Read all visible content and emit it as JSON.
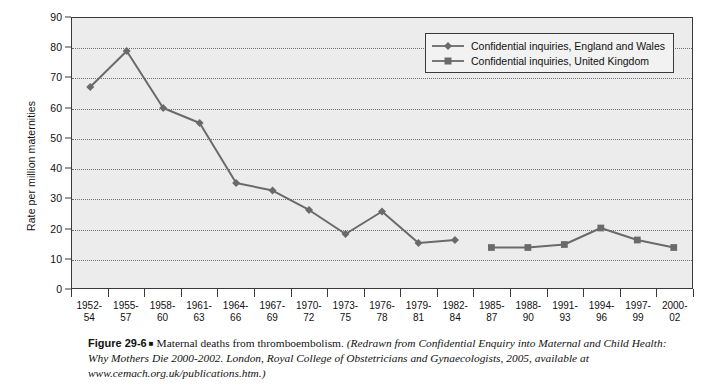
{
  "figure": {
    "number": "Figure 29-6",
    "bullet": "■",
    "description": "Maternal deaths from thromboembolism.",
    "source": "(Redrawn from Confidential Enquiry into Maternal and Child Health: Why Mothers Die 2000-2002. London, Royal College of Obstetricians and Gynaecologists, 2005, available at www.cemach.org.uk/publications.htm.)"
  },
  "colors": {
    "series_line": "#6a6a6a",
    "plot_background": "#ececec",
    "axis": "#3a3a3a",
    "gridline": "#6e6e6e",
    "text": "#111111"
  },
  "chart_data": {
    "type": "line",
    "title": "Maternal deaths from thromboembolism",
    "xlabel": "",
    "ylabel": "Rate per million maternities",
    "ylim": [
      0,
      90
    ],
    "ytick_step": 10,
    "yticks": [
      0,
      10,
      20,
      30,
      40,
      50,
      60,
      70,
      80,
      90
    ],
    "grid": "horizontal-dotted",
    "legend_position": "top-right-inside",
    "categories": [
      "1952-\n54",
      "1955-\n57",
      "1958-\n60",
      "1961-\n63",
      "1964-\n66",
      "1967-\n69",
      "1970-\n72",
      "1973-\n75",
      "1976-\n78",
      "1979-\n81",
      "1982-\n84",
      "1985-\n87",
      "1988-\n90",
      "1991-\n93",
      "1994-\n96",
      "1997-\n99",
      "2000-\n02"
    ],
    "category_lines": [
      [
        "1952-",
        "54"
      ],
      [
        "1955-",
        "57"
      ],
      [
        "1958-",
        "60"
      ],
      [
        "1961-",
        "63"
      ],
      [
        "1964-",
        "66"
      ],
      [
        "1967-",
        "69"
      ],
      [
        "1970-",
        "72"
      ],
      [
        "1973-",
        "75"
      ],
      [
        "1976-",
        "78"
      ],
      [
        "1979-",
        "81"
      ],
      [
        "1982-",
        "84"
      ],
      [
        "1985-",
        "87"
      ],
      [
        "1988-",
        "90"
      ],
      [
        "1991-",
        "93"
      ],
      [
        "1994-",
        "96"
      ],
      [
        "1997-",
        "99"
      ],
      [
        "2000-",
        "02"
      ]
    ],
    "series": [
      {
        "name": "Confidential inquiries, England and Wales",
        "marker": "diamond",
        "color": "#6a6a6a",
        "values": [
          67,
          79,
          60,
          55,
          35,
          32.5,
          26,
          18,
          25.5,
          15,
          16,
          null,
          null,
          null,
          null,
          null,
          null
        ]
      },
      {
        "name": "Confidential inquiries, United Kingdom",
        "marker": "square",
        "color": "#6a6a6a",
        "values": [
          null,
          null,
          null,
          null,
          null,
          null,
          null,
          null,
          null,
          null,
          null,
          13.5,
          13.5,
          14.5,
          20,
          16,
          13.5
        ]
      }
    ]
  },
  "legend": {
    "items": [
      {
        "label": "Confidential inquiries, England and Wales",
        "marker": "diamond"
      },
      {
        "label": "Confidential inquiries, United Kingdom",
        "marker": "square"
      }
    ]
  }
}
